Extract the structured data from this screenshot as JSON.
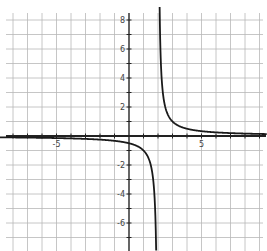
{
  "chart_data": {
    "type": "line",
    "title": "",
    "xlabel": "",
    "ylabel": "",
    "function": "y = 1/(x - 2)",
    "vertical_asymptote": 2,
    "horizontal_asymptote": 0,
    "xlim": [
      -8.9,
      9.5
    ],
    "ylim": [
      -7.9,
      9.0
    ],
    "grid": true,
    "grid_step": 1,
    "x_tick_labels": [
      {
        "value": -5,
        "label": "-5"
      },
      {
        "value": 5,
        "label": "5"
      }
    ],
    "y_tick_labels": [
      {
        "value": 8,
        "label": "8"
      },
      {
        "value": 6,
        "label": "6"
      },
      {
        "value": 4,
        "label": "4"
      },
      {
        "value": 2,
        "label": "2"
      },
      {
        "value": -2,
        "label": "-2"
      },
      {
        "value": -4,
        "label": "-4"
      },
      {
        "value": -6,
        "label": "-6"
      }
    ],
    "series": [
      {
        "name": "left branch",
        "x": [
          -9,
          -7,
          -5,
          -3,
          -1,
          0,
          1,
          1.5,
          1.8,
          1.88
        ],
        "y": [
          -0.09,
          -0.11,
          -0.14,
          -0.2,
          -0.33,
          -0.5,
          -1,
          -2,
          -5,
          -8
        ]
      },
      {
        "name": "right branch",
        "x": [
          2.11,
          2.2,
          2.5,
          3,
          4,
          5,
          7,
          9.5
        ],
        "y": [
          9,
          5,
          2,
          1,
          0.5,
          0.33,
          0.2,
          0.13
        ]
      }
    ],
    "legend": null,
    "colors": {
      "grid": "#b8b8b8",
      "axis": "#222222",
      "curve": "#1a1a1a",
      "background": "#ffffff"
    }
  }
}
